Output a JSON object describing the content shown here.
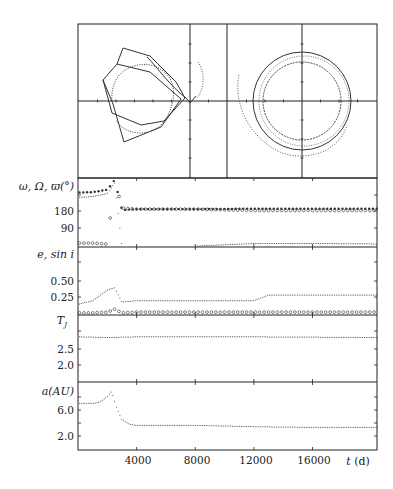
{
  "chart_data": [
    {
      "type": "scatter",
      "panel": "orbit-projections",
      "title": "",
      "subpanels": [
        {
          "name": "left",
          "description": "rotating-frame trajectory: pentagonal loop with curved trailing arc",
          "axes": "cross at center",
          "grid": false
        },
        {
          "name": "right",
          "description": "concentric near-circular trajectories about the origin with an open outer dotted arc",
          "axes": "cross at center",
          "grid": false
        }
      ]
    },
    {
      "type": "scatter",
      "panel": "angles",
      "ylabel": "ω, Ω, ϖ(°)",
      "yticks": [
        90,
        180
      ],
      "ylim": [
        0,
        355
      ],
      "x": [
        0,
        1000,
        2000,
        2500,
        3000,
        4000,
        8000,
        12000,
        16000,
        20400
      ],
      "series": [
        {
          "name": "ω (filled)",
          "values": [
            280,
            282,
            295,
            345,
            190,
            195,
            195,
            197,
            197,
            197
          ]
        },
        {
          "name": "Ω (open)",
          "values": [
            20,
            20,
            15,
            350,
            200,
            195,
            195,
            188,
            188,
            188
          ]
        },
        {
          "name": "ϖ (dots)",
          "values": [
            255,
            260,
            275,
            330,
            5,
            5,
            5,
            18,
            18,
            16
          ]
        }
      ]
    },
    {
      "type": "scatter",
      "panel": "eccentricity-inclination",
      "ylabel": "e, sin i",
      "yticks": [
        0.25,
        0.5
      ],
      "ylim": [
        0,
        0.95
      ],
      "x": [
        0,
        1000,
        2000,
        2500,
        3000,
        4000,
        8000,
        12000,
        13000,
        16000,
        20400
      ],
      "series": [
        {
          "name": "e (dots)",
          "values": [
            0.15,
            0.2,
            0.35,
            0.38,
            0.18,
            0.2,
            0.2,
            0.2,
            0.28,
            0.28,
            0.28
          ]
        },
        {
          "name": "sin i (open)",
          "values": [
            0.03,
            0.03,
            0.04,
            0.08,
            0.03,
            0.04,
            0.04,
            0.04,
            0.04,
            0.04,
            0.04
          ]
        }
      ]
    },
    {
      "type": "scatter",
      "panel": "tisserand",
      "ylabel": "T_J",
      "yticks": [
        2.0,
        2.5
      ],
      "ylim": [
        1.7,
        3.7
      ],
      "x": [
        0,
        2000,
        4000,
        8000,
        12000,
        16000,
        20400
      ],
      "series": [
        {
          "name": "T_J",
          "values": [
            3.05,
            3.03,
            3.05,
            3.05,
            3.05,
            3.04,
            3.03
          ]
        }
      ]
    },
    {
      "type": "scatter",
      "panel": "semimajor-axis",
      "ylabel": "a(AU)",
      "xlabel": "t (d)",
      "xticks": [
        4000,
        8000,
        12000,
        16000
      ],
      "yticks": [
        2.0,
        6.0
      ],
      "ylim": [
        0.0,
        10.2
      ],
      "xlim": [
        0,
        20400
      ],
      "x": [
        0,
        1000,
        1500,
        2000,
        2300,
        2600,
        3000,
        3500,
        4000,
        8000,
        12000,
        16000,
        20400
      ],
      "series": [
        {
          "name": "a",
          "values": [
            7.0,
            7.0,
            7.2,
            8.0,
            8.8,
            6.5,
            4.5,
            3.9,
            3.7,
            3.7,
            3.5,
            3.4,
            3.4
          ]
        }
      ]
    }
  ],
  "labels": {
    "angles": "ω, Ω, ϖ(°)",
    "ecc": "e, sin i",
    "tj_main": "T",
    "tj_sub": "J",
    "a": "a(AU)",
    "tlabel": "t (d)",
    "tick_180": "180",
    "tick_90": "90",
    "tick_050": "0.50",
    "tick_025": "0.25",
    "tick_25": "2.5",
    "tick_20": "2.0",
    "tick_60": "6.0",
    "tick_a20": "2.0",
    "x4000": "4000",
    "x8000": "8000",
    "x12000": "12000",
    "x16000": "16000"
  }
}
